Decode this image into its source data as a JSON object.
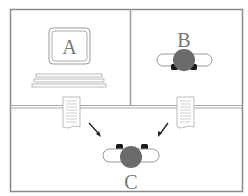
{
  "diagram": {
    "panels": [
      {
        "id": "top-left",
        "label": "A",
        "content": "computer"
      },
      {
        "id": "top-right",
        "label": "B",
        "content": "robot"
      },
      {
        "id": "bottom",
        "label": "C",
        "content": "robot"
      }
    ],
    "documents": [
      {
        "from": "A",
        "to": "C"
      },
      {
        "from": "B",
        "to": "C"
      }
    ],
    "labels": {
      "a": "A",
      "b": "B",
      "c": "C"
    },
    "colors": {
      "frame": "#8a8a8a",
      "robot_body": "#6b6b6b",
      "wheels": "#1a1a1a",
      "text": "#777777"
    }
  }
}
